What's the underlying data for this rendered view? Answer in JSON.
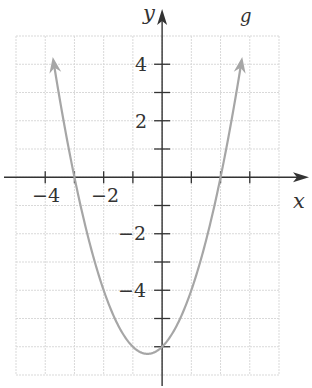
{
  "chart_data": {
    "type": "line",
    "title": "",
    "xlabel": "x",
    "ylabel": "y",
    "xlim": [
      -5,
      4
    ],
    "ylim": [
      -7,
      5
    ],
    "grid": true,
    "x_ticks": [
      -4,
      -3,
      -2,
      -1,
      1,
      2,
      3
    ],
    "x_tick_labels": [
      "-4",
      "-2"
    ],
    "y_ticks": [
      -6,
      -5,
      -4,
      -3,
      -2,
      -1,
      1,
      2,
      3,
      4
    ],
    "y_tick_labels": [
      "4",
      "2",
      "-2",
      "-4"
    ],
    "series": [
      {
        "name": "g",
        "equation": "g(x) = x^2 + x - 6",
        "color": "#a6a6a6",
        "x": [
          -3.5,
          -3,
          -2.5,
          -2,
          -1.5,
          -1,
          -0.5,
          0,
          0.5,
          1,
          1.5,
          2,
          2.5
        ],
        "y": [
          0.75,
          0,
          -0.75,
          -4,
          -5.25,
          -6,
          -6.25,
          -6,
          -5.25,
          -4,
          -2.25,
          0,
          2.75
        ],
        "vertex": [
          -0.5,
          -6.25
        ],
        "x_intercepts": [
          -3,
          2
        ],
        "y_intercept": -6,
        "arrows_at_ends": true
      }
    ]
  },
  "labels": {
    "x_axis": "x",
    "y_axis": "y",
    "curve": "g",
    "tick_neg4": "−4",
    "tick_neg2": "−2",
    "tick_4": "4",
    "tick_2": "2",
    "tick_y_neg2": "−2",
    "tick_y_neg4": "−4"
  },
  "colors": {
    "axis": "#333333",
    "grid": "#d9d9d9",
    "curve": "#a6a6a6",
    "curve_label": "#b3b3b3"
  }
}
